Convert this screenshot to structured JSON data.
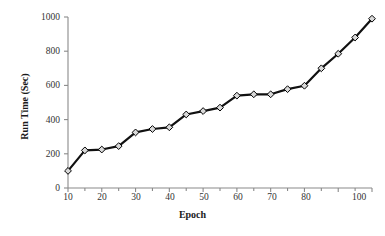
{
  "chart_data": {
    "type": "line",
    "title": "",
    "xlabel": "Epoch",
    "ylabel": "Run Time (Sec)",
    "x": [
      10,
      15,
      20,
      25,
      30,
      35,
      40,
      45,
      50,
      55,
      60,
      65,
      70,
      75,
      80,
      85,
      90,
      95,
      100
    ],
    "values": [
      100,
      220,
      225,
      245,
      325,
      345,
      355,
      430,
      450,
      470,
      540,
      548,
      548,
      578,
      598,
      700,
      785,
      880,
      990
    ],
    "series": [
      {
        "name": "Run Time",
        "values": [
          100,
          220,
          225,
          245,
          325,
          345,
          355,
          430,
          450,
          470,
          540,
          548,
          548,
          578,
          598,
          700,
          785,
          880,
          990
        ]
      }
    ],
    "xlim": [
      10,
      100
    ],
    "ylim": [
      0,
      1000
    ],
    "xticks": [
      10,
      20,
      30,
      40,
      50,
      60,
      70,
      80,
      90,
      100
    ],
    "xtick_labels": [
      "10",
      "20",
      "30",
      "40",
      "50",
      "60",
      "70",
      "80",
      "",
      "100"
    ],
    "yticks": [
      0,
      200,
      400,
      600,
      800,
      1000
    ],
    "ytick_labels": [
      "0",
      "200",
      "400",
      "600",
      "800",
      "1000"
    ],
    "grid": false,
    "legend": false,
    "marker": "diamond",
    "marker_face_color": "#d9d9d9",
    "marker_edge_color": "#000000",
    "line_color": "#111111",
    "line_width": 2.2,
    "axis_color": "#8a8a8a",
    "background": "#ffffff"
  }
}
